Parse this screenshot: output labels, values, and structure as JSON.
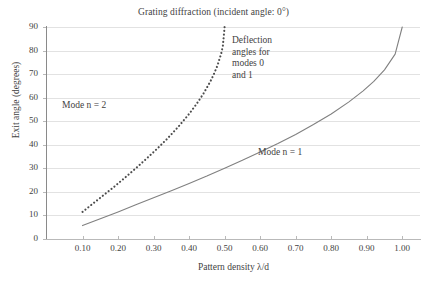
{
  "chart_data": {
    "type": "line",
    "title": "Grating diffraction (incident angle: 0°)",
    "xlabel": "Pattern density λ/d",
    "ylabel": "Exit angle (degrees)",
    "xlim": [
      0.0,
      1.05
    ],
    "ylim": [
      0,
      90
    ],
    "xticks": [
      0.1,
      0.2,
      0.3,
      0.4,
      0.5,
      0.6,
      0.7,
      0.8,
      0.9,
      1.0
    ],
    "xtick_labels": [
      "0.10",
      "0.20",
      "0.30",
      "0.40",
      "0.50",
      "0.60",
      "0.70",
      "0.80",
      "0.90",
      "1.00"
    ],
    "yticks": [
      0,
      10,
      20,
      30,
      40,
      50,
      60,
      70,
      80,
      90
    ],
    "ytick_labels": [
      "0",
      "10",
      "20",
      "30",
      "40",
      "50",
      "60",
      "70",
      "80",
      "90"
    ],
    "grid": "horizontal",
    "legend": "inline-annotations",
    "series": [
      {
        "name": "Mode n = 1",
        "style": "solid",
        "color": "#808080",
        "label_text": "Mode n = 1",
        "x": [
          0.1,
          0.15,
          0.2,
          0.25,
          0.3,
          0.35,
          0.4,
          0.45,
          0.5,
          0.55,
          0.6,
          0.65,
          0.7,
          0.75,
          0.8,
          0.85,
          0.89,
          0.92,
          0.95,
          0.98,
          1.0
        ],
        "y": [
          5.7,
          8.6,
          11.5,
          14.5,
          17.5,
          20.5,
          23.6,
          26.7,
          30.0,
          33.4,
          36.9,
          40.5,
          44.4,
          48.6,
          53.1,
          58.2,
          62.9,
          66.9,
          71.8,
          78.5,
          90.0
        ]
      },
      {
        "name": "Mode n = 2",
        "style": "dotted",
        "color": "#4d4d4d",
        "label_text": "Mode n = 2",
        "x": [
          0.1,
          0.13,
          0.16,
          0.19,
          0.22,
          0.25,
          0.28,
          0.31,
          0.34,
          0.37,
          0.4,
          0.42,
          0.44,
          0.46,
          0.47,
          0.48,
          0.49,
          0.495,
          0.5
        ],
        "y": [
          11.5,
          15.1,
          18.7,
          22.3,
          26.1,
          30.0,
          34.1,
          38.3,
          42.8,
          47.7,
          53.1,
          57.1,
          61.6,
          66.9,
          70.1,
          73.7,
          78.5,
          81.9,
          90.0
        ]
      }
    ],
    "annotations": [
      {
        "name": "deflection-note",
        "lines": [
          "Deflection",
          "angles for",
          "modes 0",
          "and 1"
        ],
        "x": 0.555,
        "y": 84
      }
    ]
  }
}
